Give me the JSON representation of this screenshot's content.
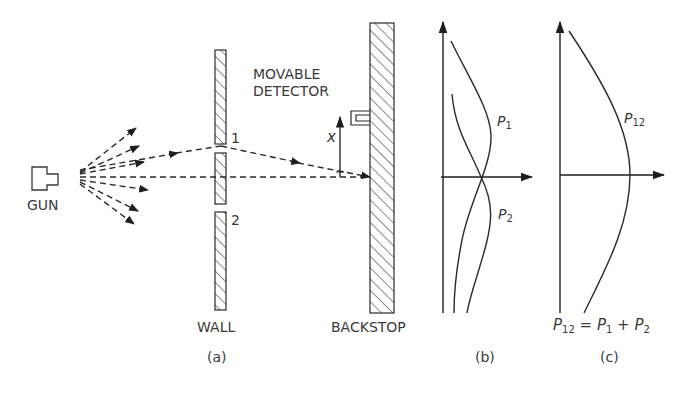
{
  "figure": {
    "panels": [
      {
        "id": "a",
        "caption": "(a)"
      },
      {
        "id": "b",
        "caption": "(b)"
      },
      {
        "id": "c",
        "caption": "(c)"
      }
    ]
  },
  "panel_a": {
    "gun_label": "GUN",
    "wall_label": "WALL",
    "backstop_label": "BACKSTOP",
    "detector_label_line1": "MOVABLE",
    "detector_label_line2": "DETECTOR",
    "hole1_label": "1",
    "hole2_label": "2",
    "position_label": "x"
  },
  "panel_b": {
    "curve1_label": "P",
    "curve1_sub": "1",
    "curve2_label": "P",
    "curve2_sub": "2"
  },
  "panel_c": {
    "curve_label": "P",
    "curve_sub": "12",
    "equation": {
      "lhs": "P",
      "lhs_sub": "12",
      "eq": " = ",
      "t1": "P",
      "t1_sub": "1",
      "plus": " + ",
      "t2": "P",
      "t2_sub": "2"
    }
  },
  "colors": {
    "ink": "#2a2a2a",
    "background": "#ffffff"
  }
}
